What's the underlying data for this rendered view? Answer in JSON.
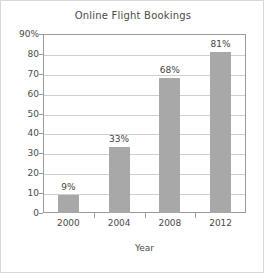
{
  "chart_data": {
    "type": "bar",
    "title": "Online Flight Bookings",
    "xlabel": "Year",
    "ylabel": "",
    "categories": [
      "2000",
      "2004",
      "2008",
      "2012"
    ],
    "values": [
      9,
      33,
      68,
      81
    ],
    "value_labels": [
      "9%",
      "33%",
      "68%",
      "81%"
    ],
    "ylim": [
      0,
      90
    ],
    "ytick_values": [
      0,
      10,
      20,
      30,
      40,
      50,
      60,
      70,
      80,
      90
    ],
    "ytick_labels": [
      "0",
      "10",
      "20",
      "30",
      "40",
      "50",
      "60",
      "70",
      "80",
      "90%"
    ],
    "grid": "horizontal",
    "legend": "none",
    "series": [
      {
        "name": "Online Flight Bookings",
        "values": [
          9,
          33,
          68,
          81
        ],
        "color": "#a8a8a8"
      }
    ],
    "colors": {
      "bar": "#a8a8a8",
      "gridline": "#cfcfcf",
      "axis": "#9a9a9a",
      "text": "#4a4a4a",
      "frame": "#d8d8d8",
      "background": "#ffffff"
    }
  }
}
